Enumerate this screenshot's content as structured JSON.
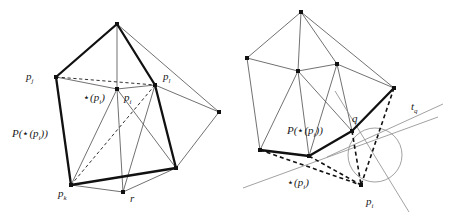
{
  "figure": {
    "domain": "diagram",
    "colors": {
      "ink": "#1a1a1a",
      "thin_line": "#4d4d4d",
      "background": "#ffffff"
    },
    "panels": [
      {
        "id": "left-panel",
        "name": "left-diagram",
        "labels": [
          {
            "id": "pj",
            "text": "p",
            "sub": "j",
            "x": 26,
            "y": 80
          },
          {
            "id": "pl",
            "text": "p",
            "sub": "l",
            "x": 163,
            "y": 80
          },
          {
            "id": "star-pi",
            "text": "⋆(p",
            "sub": "i",
            "tail": ")",
            "x": 83,
            "y": 101
          },
          {
            "id": "pi",
            "text": "p",
            "sub": "i",
            "x": 124,
            "y": 101
          },
          {
            "id": "P-star-pi",
            "text": "P(⋆(p",
            "sub": "i",
            "tail": "))",
            "x": 12,
            "y": 137
          },
          {
            "id": "pk",
            "text": "p",
            "sub": "k",
            "x": 58,
            "y": 197
          },
          {
            "id": "r",
            "text": "r",
            "sub": "",
            "x": 130,
            "y": 202
          }
        ],
        "vertices": [
          {
            "name": "apex",
            "x": 117,
            "y": 24
          },
          {
            "name": "pj",
            "x": 56,
            "y": 77
          },
          {
            "name": "pl",
            "x": 155,
            "y": 85
          },
          {
            "name": "pi",
            "x": 117,
            "y": 89
          },
          {
            "name": "right",
            "x": 219,
            "y": 112
          },
          {
            "name": "lower-right",
            "x": 176,
            "y": 168
          },
          {
            "name": "pk",
            "x": 71,
            "y": 185
          },
          {
            "name": "r",
            "x": 123,
            "y": 192
          }
        ]
      },
      {
        "id": "right-panel",
        "name": "right-diagram",
        "labels": [
          {
            "id": "P-star-pi",
            "text": "P(⋆(p",
            "sub": "i",
            "tail": "))",
            "x": 287,
            "y": 134
          },
          {
            "id": "q",
            "text": "q",
            "sub": "",
            "x": 352,
            "y": 122
          },
          {
            "id": "tq",
            "text": "t",
            "sub": "q",
            "x": 411,
            "y": 110
          },
          {
            "id": "star-pi",
            "text": "⋆(p",
            "sub": "i",
            "tail": ")",
            "x": 287,
            "y": 186
          },
          {
            "id": "pi",
            "text": "p",
            "sub": "i",
            "x": 366,
            "y": 205
          }
        ],
        "vertices": [
          {
            "name": "apex",
            "x": 301,
            "y": 12
          },
          {
            "name": "upper-left",
            "x": 247,
            "y": 58
          },
          {
            "name": "center",
            "x": 298,
            "y": 71
          },
          {
            "name": "upper-right",
            "x": 337,
            "y": 64
          },
          {
            "name": "right",
            "x": 394,
            "y": 88
          },
          {
            "name": "q",
            "x": 352,
            "y": 131
          },
          {
            "name": "bottom-mid",
            "x": 309,
            "y": 156
          },
          {
            "name": "bottom-left",
            "x": 260,
            "y": 150
          },
          {
            "name": "pi",
            "x": 361,
            "y": 185
          }
        ],
        "circle": {
          "cx": 375,
          "cy": 155,
          "r": 27
        }
      }
    ]
  }
}
